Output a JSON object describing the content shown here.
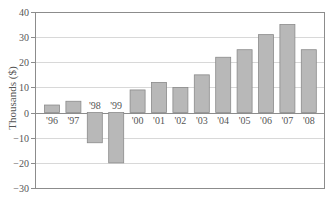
{
  "chart_data": {
    "type": "bar",
    "title": "",
    "xlabel": "",
    "ylabel": "Thousands ($)",
    "ylim": [
      -30,
      40
    ],
    "yticks": [
      40,
      30,
      20,
      10,
      0,
      -10,
      -20,
      -30
    ],
    "grid": true,
    "legend": null,
    "categories": [
      "'96",
      "'97",
      "'98",
      "'99",
      "'00",
      "'01",
      "'02",
      "'03",
      "'04",
      "'05",
      "'06",
      "'07",
      "'08"
    ],
    "values": [
      3,
      4.5,
      -12,
      -20,
      9,
      12,
      10,
      15,
      22,
      25,
      31,
      35,
      25
    ]
  },
  "colors": {
    "bar_fill": "#b8b8b8",
    "bar_stroke": "#8a8a8a",
    "grid": "#d8d8d8",
    "frame": "#8c8c8c",
    "text": "#555555"
  }
}
